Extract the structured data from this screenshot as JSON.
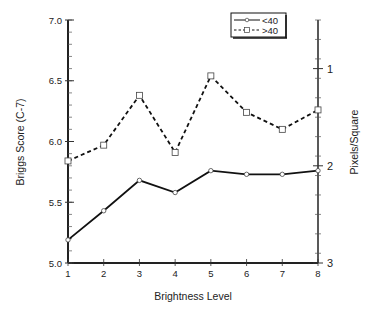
{
  "chart_data": {
    "type": "line",
    "title": "",
    "xlabel": "Brightness Level",
    "ylabel": "Briggs Score (C-7)",
    "y2label": "Pixels/Square",
    "x": [
      1,
      2,
      3,
      4,
      5,
      6,
      7,
      8
    ],
    "xticks": [
      "1",
      "2",
      "3",
      "4",
      "5",
      "6",
      "7",
      "8"
    ],
    "xlim": [
      1,
      8
    ],
    "ylim": [
      5.0,
      7.0
    ],
    "yticks": [
      "5.0",
      "5.5",
      "6.0",
      "6.5",
      "7.0"
    ],
    "ytick_values": [
      5.0,
      5.5,
      6.0,
      6.5,
      7.0
    ],
    "y2lim": [
      0.5,
      3
    ],
    "y2ticks": [
      "1",
      "2",
      "3"
    ],
    "y2tick_values": [
      1,
      2,
      3
    ],
    "y2_inverted": true,
    "grid": false,
    "legend_position": "top-right",
    "series": [
      {
        "name": "<40",
        "style": "solid",
        "marker": "circle",
        "values": [
          5.19,
          5.43,
          5.68,
          5.58,
          5.76,
          5.73,
          5.73,
          5.76
        ]
      },
      {
        "name": ">40",
        "style": "dashed",
        "marker": "square",
        "values": [
          5.84,
          5.97,
          6.38,
          5.91,
          6.54,
          6.24,
          6.1,
          6.26
        ]
      }
    ]
  }
}
